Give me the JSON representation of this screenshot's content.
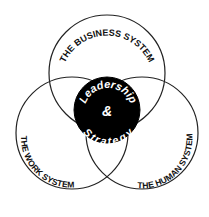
{
  "diagram": {
    "type": "venn",
    "circles": [
      {
        "id": "business",
        "label": "THE BUSINESS SYSTEM",
        "shaded": false
      },
      {
        "id": "work",
        "label": "THE WORK SYSTEM",
        "shaded": true
      },
      {
        "id": "human",
        "label": "THE HUMAN SYSTEM",
        "shaded": false
      }
    ],
    "center": {
      "line1": "Leadership",
      "line2": "&",
      "line3": "Strategy"
    },
    "colors": {
      "stroke": "#222222",
      "center_fill": "#000000",
      "shade_fill": "#c8c8c8",
      "background": "#ffffff"
    }
  }
}
